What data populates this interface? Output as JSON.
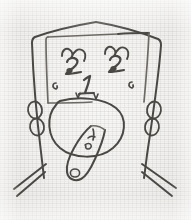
{
  "artwork": {
    "title": "Hand-drawn face sketch",
    "medium": "pencil on graph paper",
    "background_color": "#f1f0ee",
    "ink_color": "#4a4844",
    "canvas": {
      "width": 191,
      "height": 220
    }
  },
  "figure": {
    "name": "stylized face",
    "parts": [
      {
        "name": "head-outline",
        "label": "head outline"
      },
      {
        "name": "forehead-panel",
        "label": "inner forehead panel"
      },
      {
        "name": "left-eye",
        "label": "left eye"
      },
      {
        "name": "right-eye",
        "label": "right eye"
      },
      {
        "name": "left-eyebrow",
        "label": "left eyebrow"
      },
      {
        "name": "right-eyebrow",
        "label": "right eyebrow"
      },
      {
        "name": "nose",
        "label": "nose"
      },
      {
        "name": "left-cheek-mark",
        "label": "left cheek mark"
      },
      {
        "name": "right-cheek-mark",
        "label": "right cheek mark"
      },
      {
        "name": "nostril-marks",
        "label": "nostril marks"
      },
      {
        "name": "jaw-oval",
        "label": "jaw oval"
      },
      {
        "name": "tongue",
        "label": "tongue"
      },
      {
        "name": "tongue-marks",
        "label": "tongue markings"
      },
      {
        "name": "tongue-tip-loop",
        "label": "tongue tip loop"
      },
      {
        "name": "left-ear",
        "label": "left ear"
      },
      {
        "name": "right-ear",
        "label": "right ear"
      },
      {
        "name": "left-whiskers",
        "label": "left whiskers"
      },
      {
        "name": "right-whiskers",
        "label": "right whiskers"
      }
    ]
  },
  "annotations": {
    "nose_numeral": "1",
    "left_eye_numeral": "2",
    "right_eye_numeral": "3",
    "left_cheek_numeral": "6",
    "right_cheek_numeral": "6",
    "tongue_numeral": "4",
    "tongue_sub_numeral": "5"
  }
}
